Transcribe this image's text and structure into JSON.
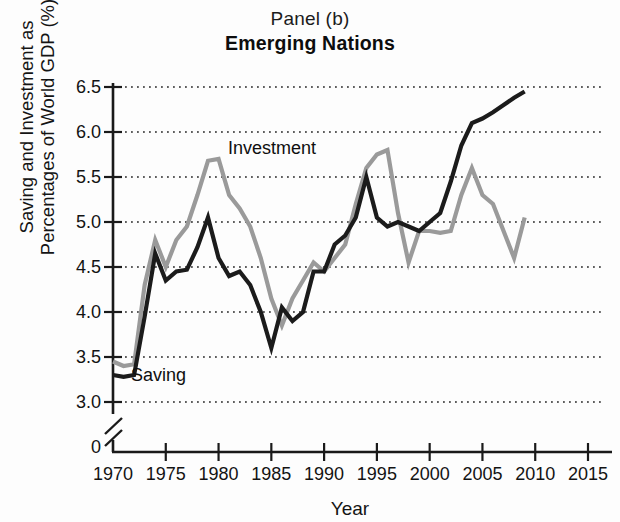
{
  "header": {
    "panel_label": "Panel (b)",
    "title": "Emerging Nations"
  },
  "axis": {
    "ylabel_line1": "Saving and Investment as",
    "ylabel_line2": "Percentages of World GDP (%)",
    "xlabel": "Year"
  },
  "annotations": {
    "investment_tag": "Investment",
    "saving_tag": "Saving"
  },
  "colors": {
    "saving": "#1b1b1b",
    "investment": "#9a9a9a",
    "axis": "#1a1a1a",
    "grid": "#2a2a2a"
  },
  "chart_data": {
    "type": "line",
    "title": "Emerging Nations",
    "subtitle": "Panel (b)",
    "xlabel": "Year",
    "ylabel": "Saving and Investment as Percentages of World GDP (%)",
    "xlim": [
      1970,
      2015
    ],
    "ylim": [
      3.0,
      6.5
    ],
    "y_axis_break": true,
    "y_zero_tick": "0",
    "ytick_labels": [
      "6.5",
      "6.0",
      "5.5",
      "5.0",
      "4.5",
      "4.0",
      "3.5",
      "3.0"
    ],
    "yticks": [
      6.5,
      6.0,
      5.5,
      5.0,
      4.5,
      4.0,
      3.5,
      3.0
    ],
    "xtick_labels": [
      "1970",
      "1975",
      "1980",
      "1985",
      "1990",
      "1995",
      "2000",
      "2005",
      "2010",
      "2015"
    ],
    "xticks": [
      1970,
      1975,
      1980,
      1985,
      1990,
      1995,
      2000,
      2005,
      2010,
      2015
    ],
    "grid": "horizontal-dotted",
    "legend": "inline-labels",
    "x": [
      1970,
      1971,
      1972,
      1973,
      1974,
      1975,
      1976,
      1977,
      1978,
      1979,
      1980,
      1981,
      1982,
      1983,
      1984,
      1985,
      1986,
      1987,
      1988,
      1989,
      1990,
      1991,
      1992,
      1993,
      1994,
      1995,
      1996,
      1997,
      1998,
      1999,
      2000,
      2001,
      2002,
      2003,
      2004,
      2005,
      2006,
      2007,
      2008,
      2009
    ],
    "series": [
      {
        "name": "Saving",
        "color": "#1b1b1b",
        "values": [
          3.3,
          3.28,
          3.3,
          3.95,
          4.65,
          4.35,
          4.45,
          4.47,
          4.72,
          5.05,
          4.6,
          4.4,
          4.45,
          4.3,
          4.0,
          3.6,
          4.05,
          3.9,
          4.0,
          4.45,
          4.45,
          4.75,
          4.85,
          5.05,
          5.5,
          5.05,
          4.95,
          5.0,
          4.95,
          4.9,
          5.0,
          5.1,
          5.45,
          5.85,
          6.1,
          6.15,
          6.22,
          6.3,
          6.38,
          6.45
        ]
      },
      {
        "name": "Investment",
        "color": "#9a9a9a",
        "values": [
          3.45,
          3.4,
          3.42,
          4.3,
          4.8,
          4.5,
          4.8,
          4.95,
          5.3,
          5.68,
          5.7,
          5.3,
          5.15,
          4.95,
          4.6,
          4.15,
          3.85,
          4.15,
          4.35,
          4.55,
          4.45,
          4.6,
          4.75,
          5.2,
          5.6,
          5.75,
          5.8,
          5.1,
          4.55,
          4.9,
          4.9,
          4.88,
          4.9,
          5.3,
          5.6,
          5.3,
          5.2,
          4.9,
          4.6,
          5.05
        ]
      }
    ]
  }
}
